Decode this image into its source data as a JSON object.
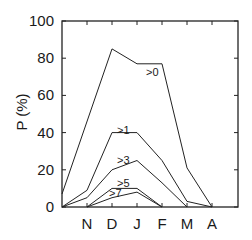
{
  "chart_data": {
    "type": "line",
    "title": "",
    "xlabel": "",
    "ylabel": "P (%)",
    "ylim": [
      0,
      100
    ],
    "yticks": [
      0,
      20,
      40,
      60,
      80,
      100
    ],
    "ytick_labels": [
      "0",
      "20",
      "40",
      "60",
      "80",
      "100"
    ],
    "x": [
      "O",
      "N",
      "D",
      "J",
      "F",
      "M",
      "A"
    ],
    "xtick_labels": [
      "",
      "N",
      "D",
      "J",
      "F",
      "M",
      "A"
    ],
    "grid": false,
    "legend": "inline labels",
    "series": [
      {
        "name": ">0",
        "label": ">0",
        "values": [
          7,
          null,
          85,
          77,
          77,
          21,
          0
        ]
      },
      {
        "name": ">1",
        "label": ">1",
        "values": [
          0,
          9,
          40,
          40,
          25,
          3,
          0
        ]
      },
      {
        "name": ">3",
        "label": ">3",
        "values": [
          0,
          5,
          20,
          25,
          13,
          0,
          null
        ]
      },
      {
        "name": ">5",
        "label": ">5",
        "values": [
          null,
          0,
          10,
          10,
          0,
          null,
          null
        ]
      },
      {
        "name": ">7",
        "label": ">7",
        "values": [
          null,
          0,
          5,
          8,
          0,
          null,
          null
        ]
      }
    ]
  }
}
